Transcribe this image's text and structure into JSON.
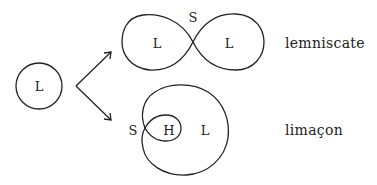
{
  "diagram": {
    "source": {
      "label": "L"
    },
    "lemniscate": {
      "left_lobe_label": "L",
      "right_lobe_label": "L",
      "crossing_label": "S",
      "name": "lemniscate"
    },
    "limacon": {
      "cusp_label": "S",
      "inner_loop_label": "H",
      "outer_loop_label": "L",
      "name": "limaçon"
    },
    "colors": {
      "stroke": "#222222",
      "background": "#ffffff"
    }
  }
}
